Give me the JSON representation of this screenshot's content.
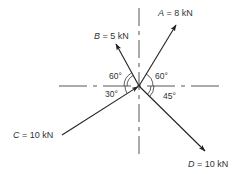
{
  "diagram": {
    "type": "force-diagram",
    "origin": {
      "x": 139,
      "y": 86
    },
    "forces": [
      {
        "id": "A",
        "name": "A",
        "magnitude": "8 kN",
        "label": "A = 8 kN",
        "angle_label": "60°",
        "angle_ref": "positive x-axis",
        "direction": "up-right, away from origin"
      },
      {
        "id": "B",
        "name": "B",
        "magnitude": "5 kN",
        "label": "B = 5 kN",
        "angle_label": "60°",
        "angle_ref": "negative x-axis",
        "direction": "up-left, away from origin"
      },
      {
        "id": "C",
        "name": "C",
        "magnitude": "10 kN",
        "label": "C = 10 kN",
        "angle_label": "30°",
        "angle_ref": "negative x-axis",
        "direction": "toward origin from lower-left"
      },
      {
        "id": "D",
        "name": "D",
        "magnitude": "10 kN",
        "label": "D = 10 kN",
        "angle_label": "45°",
        "angle_ref": "positive x-axis",
        "direction": "down-right, away from origin"
      }
    ],
    "labels": {
      "A_name": "A",
      "A_rest": " = 8 kN",
      "B_name": "B",
      "B_rest": " = 5 kN",
      "C_name": "C",
      "C_rest": " = 10 kN",
      "D_name": "D",
      "D_rest": " = 10 kN",
      "angle_A": "60°",
      "angle_B": "60°",
      "angle_C": "30°",
      "angle_D": "45°"
    },
    "colors": {
      "line": "#222222",
      "dashed": "#444444",
      "text": "#333333",
      "background": "#ffffff"
    }
  }
}
